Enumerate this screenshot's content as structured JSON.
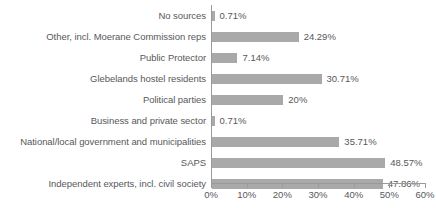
{
  "chart_data": {
    "type": "bar",
    "orientation": "horizontal",
    "title": "",
    "subtitle": "",
    "xlabel": "",
    "ylabel": "",
    "xlim": [
      0,
      60
    ],
    "grid": false,
    "legend": false,
    "bar_color": "#a9a9a9",
    "axis_color": "#9a9a9a",
    "text_color": "#58585a",
    "xticks": [
      0,
      10,
      20,
      30,
      40,
      50,
      60
    ],
    "xtick_labels": [
      "0%",
      "10%",
      "20%",
      "30%",
      "40%",
      "50%",
      "60%"
    ],
    "categories": [
      "No sources",
      "Other, incl. Moerane Commission reps",
      "Public Protector",
      "Glebelands hostel residents",
      "Political parties",
      "Business and private sector",
      "National/local government and municipalities",
      "SAPS",
      "Independent experts, incl. civil society"
    ],
    "values": [
      0.71,
      24.29,
      7.14,
      30.71,
      20,
      0.71,
      35.71,
      48.57,
      47.86
    ],
    "value_labels": [
      "0.71%",
      "24.29%",
      "7.14%",
      "30.71%",
      "20%",
      "0.71%",
      "35.71%",
      "48.57%",
      "47.86%"
    ]
  }
}
